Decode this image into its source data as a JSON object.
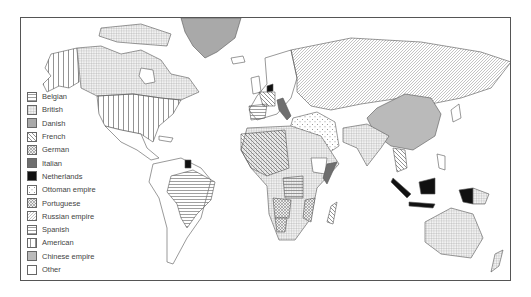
{
  "map": {
    "title": "",
    "colors": {
      "outline": "#555555",
      "pattern_line": "#777777",
      "danish": "#a9a9a9",
      "italian": "#6e6e6e",
      "netherlands": "#111111",
      "chinese": "#b8b8b8",
      "other": "#ffffff"
    }
  },
  "legend": {
    "items": [
      {
        "label": "Belgian",
        "pattern": "horizontal-lines"
      },
      {
        "label": "British",
        "pattern": "grid"
      },
      {
        "label": "Danish",
        "pattern": "solid-light-gray"
      },
      {
        "label": "French",
        "pattern": "diagonal-backslash"
      },
      {
        "label": "German",
        "pattern": "dense-crosshatch"
      },
      {
        "label": "Italian",
        "pattern": "solid-dark-gray"
      },
      {
        "label": "Netherlands",
        "pattern": "solid-black"
      },
      {
        "label": "Ottoman empire",
        "pattern": "dots"
      },
      {
        "label": "Portuguese",
        "pattern": "diamond-crosshatch"
      },
      {
        "label": "Russian empire",
        "pattern": "diagonal-slash"
      },
      {
        "label": "Spanish",
        "pattern": "horizontal-lines-dense"
      },
      {
        "label": "American",
        "pattern": "vertical-lines"
      },
      {
        "label": "Chinese empire",
        "pattern": "fine-vertical-gray"
      },
      {
        "label": "Other",
        "pattern": "blank"
      }
    ]
  }
}
